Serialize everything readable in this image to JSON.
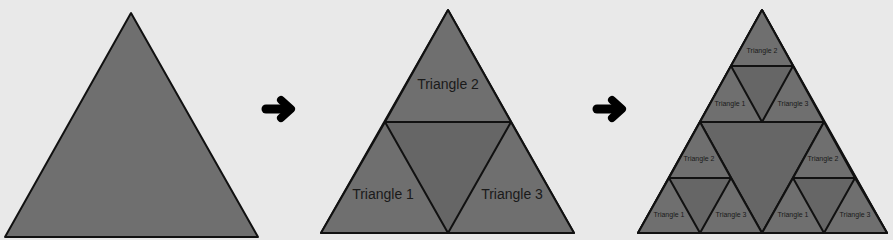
{
  "diagram": {
    "title": "",
    "stages": [
      {
        "id": "stage-1",
        "description": "Single triangle"
      },
      {
        "id": "stage-2",
        "description": "Triangle split into 3 corner triangles",
        "labels": {
          "top": "Triangle 2",
          "left": "Triangle 1",
          "right": "Triangle 3"
        }
      },
      {
        "id": "stage-3",
        "description": "Each corner triangle split again",
        "labels": {
          "top": {
            "top": "Triangle 2",
            "left": "Triangle 1",
            "right": "Triangle 3"
          },
          "left": {
            "top": "Triangle 2",
            "left": "Triangle 1",
            "right": "Triangle 3"
          },
          "right": {
            "top": "Triangle 2",
            "left": "Triangle 1",
            "right": "Triangle 3"
          }
        }
      }
    ],
    "arrows": [
      "arrow-right",
      "arrow-right"
    ],
    "colors": {
      "background": "#e9e9e9",
      "fill": "#6f6f6f",
      "center_fill": "#666666",
      "stroke": "#111111"
    }
  }
}
